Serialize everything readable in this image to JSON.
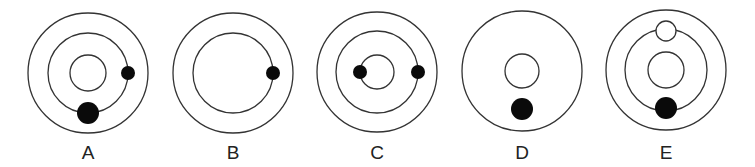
{
  "diagram": {
    "stroke_color": "#333333",
    "dot_color": "#0a0a0a",
    "figures": [
      {
        "label": "A",
        "rings": [
          "outer",
          "middle",
          "inner"
        ],
        "dots": [
          {
            "type": "filled-small",
            "position": "right on middle ring"
          },
          {
            "type": "filled-large",
            "position": "bottom on middle ring"
          }
        ]
      },
      {
        "label": "B",
        "rings": [
          "outer",
          "middle"
        ],
        "dots": [
          {
            "type": "filled-small",
            "position": "right on middle ring"
          }
        ]
      },
      {
        "label": "C",
        "rings": [
          "outer",
          "middle",
          "inner"
        ],
        "dots": [
          {
            "type": "filled-small",
            "position": "left on inner ring"
          },
          {
            "type": "filled-small",
            "position": "right on middle ring"
          }
        ]
      },
      {
        "label": "D",
        "rings": [
          "outer",
          "inner"
        ],
        "dots": [
          {
            "type": "filled-large",
            "position": "bottom between rings"
          }
        ]
      },
      {
        "label": "E",
        "rings": [
          "outer",
          "middle",
          "inner"
        ],
        "dots": [
          {
            "type": "hollow-large",
            "position": "top on middle ring"
          },
          {
            "type": "filled-large",
            "position": "bottom on middle ring"
          }
        ]
      }
    ]
  }
}
